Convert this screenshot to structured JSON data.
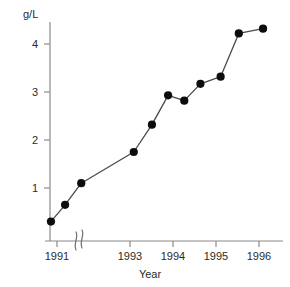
{
  "chart_data": {
    "type": "line",
    "title": "",
    "xlabel": "Year",
    "ylabel": "g/L",
    "unit_label": "g/L",
    "grid": false,
    "legend": "none",
    "marker": "filled-circle",
    "line_color": "#4a4a4a",
    "marker_color": "#0d0d0d",
    "axis_color": "#8a8a8a",
    "axis_break": {
      "present": true,
      "axis": "x",
      "between": [
        "1991",
        "1993"
      ],
      "symbol": "double-slash"
    },
    "ylim": [
      0,
      4.6
    ],
    "yticks": [
      1,
      2,
      3,
      4
    ],
    "ytick_labels": [
      "1",
      "2",
      "3",
      "4"
    ],
    "xlim": [
      1990.7,
      1996.3
    ],
    "xticks": [
      1991,
      1993,
      1994,
      1995,
      1996
    ],
    "xtick_labels": [
      "1991",
      "1993",
      "1994",
      "1995",
      "1996"
    ],
    "x": [
      1990.85,
      1991.2,
      1991.6,
      1992.9,
      1993.35,
      1993.75,
      1994.15,
      1994.55,
      1995.05,
      1995.5,
      1996.1
    ],
    "y": [
      0.3,
      0.65,
      1.1,
      1.75,
      2.32,
      2.93,
      2.82,
      3.17,
      3.32,
      4.22,
      4.32
    ],
    "values": [
      0.3,
      0.65,
      1.1,
      1.75,
      2.32,
      2.93,
      2.82,
      3.17,
      3.32,
      4.22,
      4.32
    ],
    "point_labels": [
      "0.3",
      "0.65",
      "1.1",
      "1.75",
      "2.32",
      "2.93",
      "2.82",
      "3.17",
      "3.32",
      "4.22",
      "4.32"
    ],
    "series": [
      {
        "name": "g/L",
        "values": [
          0.3,
          0.65,
          1.1,
          1.75,
          2.32,
          2.93,
          2.82,
          3.17,
          3.32,
          4.22,
          4.32
        ]
      }
    ]
  },
  "axes": {
    "y_unit": "g/L",
    "x_title": "Year"
  }
}
